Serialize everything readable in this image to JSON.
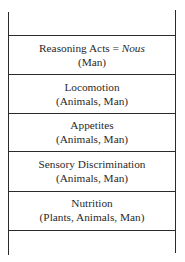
{
  "diagram": {
    "type": "stacked-layers",
    "layers": [
      {
        "title": "Reasoning Acts = ",
        "title_emphasis": "Nous",
        "beings": "(Man)"
      },
      {
        "title": "Locomotion",
        "beings": "(Animals, Man)"
      },
      {
        "title": "Appetites",
        "beings": "(Animals, Man)"
      },
      {
        "title": "Sensory Discrimination",
        "beings": "(Animals, Man)"
      },
      {
        "title": "Nutrition",
        "beings": "(Plants, Animals, Man)"
      }
    ],
    "line_color": "#2b2b2b",
    "text_color": "#2a2a2a"
  }
}
